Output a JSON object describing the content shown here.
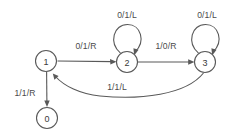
{
  "diagram": {
    "kind": "turing-machine-state-diagram",
    "width": 237,
    "height": 137,
    "background_color": "#ffffff",
    "stroke_color": "#595959",
    "text_color": "#3a3a3a",
    "states": [
      {
        "id": "0",
        "label": "0",
        "cx": 47,
        "cy": 118,
        "r": 10.5
      },
      {
        "id": "1",
        "label": "1",
        "cx": 46,
        "cy": 61,
        "r": 10.5
      },
      {
        "id": "2",
        "label": "2",
        "cx": 127,
        "cy": 62,
        "r": 10.5
      },
      {
        "id": "3",
        "label": "3",
        "cx": 205,
        "cy": 62,
        "r": 10.5
      }
    ],
    "transitions": [
      {
        "id": "t1",
        "from": "1",
        "to": "2",
        "label": "0/1/R",
        "label_x": 86,
        "label_y": 46,
        "shape": "straight-horizontal"
      },
      {
        "id": "t2",
        "from": "2",
        "to": "3",
        "label": "1/0/R",
        "label_x": 166,
        "label_y": 46,
        "shape": "straight-horizontal"
      },
      {
        "id": "t3",
        "from": "2",
        "to": "2",
        "label": "0/1/L",
        "label_x": 127,
        "label_y": 15,
        "shape": "self-loop-top"
      },
      {
        "id": "t4",
        "from": "3",
        "to": "3",
        "label": "0/1/L",
        "label_x": 207,
        "label_y": 15,
        "shape": "self-loop-top"
      },
      {
        "id": "t5",
        "from": "1",
        "to": "0",
        "label": "1/1/R",
        "label_x": 25,
        "label_y": 93,
        "shape": "straight-vertical"
      },
      {
        "id": "t6",
        "from": "3",
        "to": "1",
        "label": "1/1/L",
        "label_x": 117,
        "label_y": 87,
        "shape": "curve-below"
      }
    ]
  }
}
